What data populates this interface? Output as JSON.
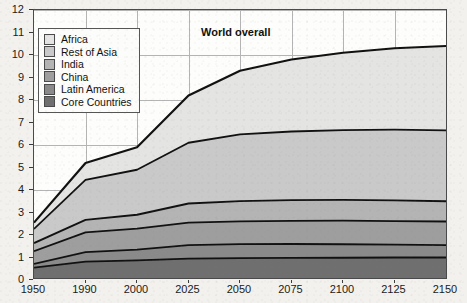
{
  "chart_data": {
    "type": "area",
    "title": "",
    "subtitle": "",
    "xlabel": "",
    "ylabel": "",
    "stacked": true,
    "grid": true,
    "legend_position": "top-left",
    "annotations": [
      {
        "text": "World overall",
        "x_category": "2050",
        "y_value": 11.0
      }
    ],
    "x": [
      "1950",
      "1990",
      "2000",
      "2025",
      "2050",
      "2075",
      "2100",
      "2125",
      "2150"
    ],
    "xlim_categories": [
      "1950",
      "2150"
    ],
    "ylim": [
      0,
      12
    ],
    "y_ticks": [
      0,
      1,
      2,
      3,
      4,
      5,
      6,
      7,
      8,
      9,
      10,
      11,
      12
    ],
    "x_ticks": [
      "1950",
      "1990",
      "2000",
      "2025",
      "2050",
      "2075",
      "2100",
      "2125",
      "2150"
    ],
    "series": [
      {
        "name": "Core Countries",
        "color": "#6f6f6f",
        "values": [
          0.55,
          0.82,
          0.87,
          0.95,
          0.97,
          0.98,
          0.99,
          1.0,
          1.0
        ]
      },
      {
        "name": "Latin America",
        "color": "#8a8a8a",
        "values": [
          0.17,
          0.42,
          0.48,
          0.6,
          0.62,
          0.62,
          0.6,
          0.57,
          0.55
        ]
      },
      {
        "name": "China",
        "color": "#9e9e9e",
        "values": [
          0.56,
          0.88,
          0.93,
          1.0,
          1.02,
          1.03,
          1.05,
          1.05,
          1.05
        ]
      },
      {
        "name": "India",
        "color": "#b4b4b4",
        "values": [
          0.36,
          0.55,
          0.62,
          0.85,
          0.9,
          0.92,
          0.92,
          0.92,
          0.9
        ]
      },
      {
        "name": "Rest of Asia",
        "color": "#c9c9c9",
        "values": [
          0.63,
          1.78,
          2.0,
          2.7,
          2.96,
          3.05,
          3.1,
          3.14,
          3.15
        ]
      },
      {
        "name": "Africa",
        "color": "#e4e4e2",
        "values": [
          0.28,
          0.75,
          1.0,
          2.1,
          2.83,
          3.2,
          3.44,
          3.62,
          3.75
        ]
      }
    ],
    "totals": [
      2.55,
      5.2,
      5.9,
      8.2,
      9.3,
      9.8,
      10.1,
      10.3,
      10.4
    ]
  },
  "legend": {
    "items": [
      {
        "label": "Africa",
        "color": "#e4e4e2"
      },
      {
        "label": "Rest of Asia",
        "color": "#c9c9c9"
      },
      {
        "label": "India",
        "color": "#b4b4b4"
      },
      {
        "label": "China",
        "color": "#9e9e9e"
      },
      {
        "label": "Latin America",
        "color": "#8a8a8a"
      },
      {
        "label": "Core Countries",
        "color": "#6f6f6f"
      }
    ]
  },
  "axis": {
    "y_labels": [
      "12",
      "11",
      "10",
      "9",
      "8",
      "7",
      "6",
      "5",
      "4",
      "3",
      "2",
      "1",
      "0"
    ],
    "x_labels": [
      "1950",
      "1990",
      "2000",
      "2025",
      "2050",
      "2075",
      "2100",
      "2125",
      "2150"
    ]
  }
}
